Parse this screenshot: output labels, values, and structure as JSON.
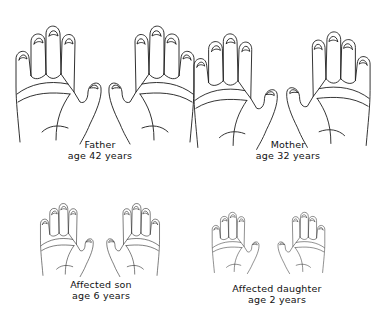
{
  "figure": {
    "subjects": [
      {
        "id": "father",
        "name": "Father",
        "age": "age  42 years"
      },
      {
        "id": "mother",
        "name": "Mother",
        "age": "age  32 years"
      },
      {
        "id": "son",
        "name": "Affected son",
        "age": "age  6 years"
      },
      {
        "id": "daughter",
        "name": "Affected daughter",
        "age": "age  2 years"
      }
    ],
    "line_color": "#1a1a1a",
    "background": "#ffffff"
  }
}
